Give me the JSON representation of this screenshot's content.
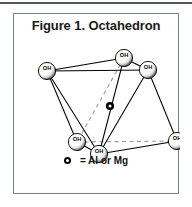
{
  "figure": {
    "title": "Figure 1. Octahedron",
    "legend": {
      "marker_name": "central-cation-marker",
      "text": "= Al or Mg"
    },
    "colors": {
      "frame_border": "#7a7f84",
      "top_rule": "#555a5e",
      "line": "#000000",
      "dashed_line": "#9a9a9a",
      "sphere_fill": "#ffffff",
      "sphere_shadow": "#000000",
      "text": "#111111"
    },
    "vertices": [
      {
        "id": "v-back-left",
        "label": "OH",
        "x": 33,
        "y": 57
      },
      {
        "id": "v-back-top",
        "label": "OH",
        "x": 110,
        "y": 44
      },
      {
        "id": "v-right-upper",
        "label": "OH",
        "x": 134,
        "y": 56
      },
      {
        "id": "v-front-left",
        "label": "OH",
        "x": 63,
        "y": 128
      },
      {
        "id": "v-front-low",
        "label": "OH",
        "x": 85,
        "y": 140
      },
      {
        "id": "v-right-lower",
        "label": "OH",
        "x": 163,
        "y": 127
      }
    ],
    "center_marker": {
      "id": "center-cation",
      "x": 96,
      "y": 92
    },
    "edges_solid": [
      [
        "v-back-left",
        "v-back-top"
      ],
      [
        "v-back-top",
        "v-right-upper"
      ],
      [
        "v-back-left",
        "v-right-upper"
      ],
      [
        "v-back-left",
        "v-front-left"
      ],
      [
        "v-back-left",
        "v-front-low"
      ],
      [
        "v-front-left",
        "v-front-low"
      ],
      [
        "v-front-low",
        "v-right-lower"
      ],
      [
        "v-front-left",
        "v-right-lower"
      ],
      [
        "v-right-upper",
        "v-front-low"
      ],
      [
        "v-right-upper",
        "v-right-lower"
      ],
      [
        "v-back-top",
        "v-front-low"
      ]
    ],
    "edges_dashed": [
      [
        "v-back-top",
        "v-front-left"
      ],
      [
        "v-front-left",
        "v-right-lower"
      ]
    ]
  }
}
